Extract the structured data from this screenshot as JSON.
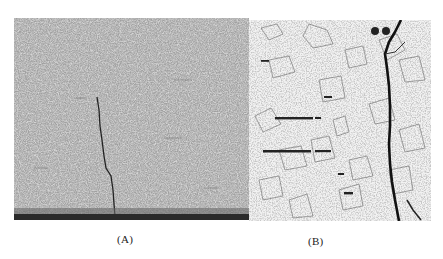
{
  "figure": {
    "panels": [
      {
        "id": "A",
        "label": "(A)",
        "description": "Fine-grained micrograph with thin vertical crack propagating from bottom edge",
        "tone": "dark speckled gray"
      },
      {
        "id": "B",
        "label": "(B)",
        "description": "Coarse-grained micrograph with wide dark crack along right side and horizontal dark inclusion streaks",
        "tone": "light with outlined grains"
      }
    ],
    "colors": {
      "background": "#ffffff",
      "panel_a_base": "#bdbdbd",
      "panel_b_base": "#f1f1f1",
      "crack": "#1a1a1a"
    }
  }
}
